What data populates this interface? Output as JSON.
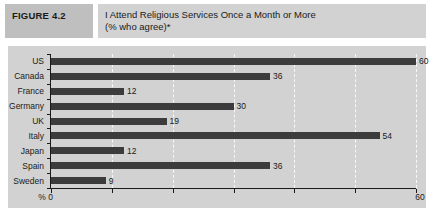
{
  "figure": {
    "label": "FIGURE 4.2",
    "title_line1": "I Attend Religious Services Once a Month or More",
    "title_line2": "(% who agree)*"
  },
  "chart_data": {
    "type": "bar",
    "orientation": "horizontal",
    "title": "I Attend Religious Services Once a Month or More (% who agree)*",
    "categories": [
      "US",
      "Canada",
      "France",
      "Germany",
      "UK",
      "Italy",
      "Japan",
      "Spain",
      "Sweden"
    ],
    "values": [
      60,
      36,
      12,
      30,
      19,
      54,
      12,
      36,
      9
    ],
    "xlim": [
      0,
      60
    ],
    "tick_interval": 10,
    "x_axis_left_label": "% 0",
    "x_axis_right_label": "60",
    "grid": "vertical-dashed-white",
    "legend": "none",
    "value_labels": "right-of-bar",
    "colors": {
      "bar": "#3c3c3c",
      "panel_bg": "#d2d2d2",
      "figure_label_bg": "#bfbfbf",
      "title_bg": "#d2d2d2",
      "gridline": "#ffffff",
      "axis": "#1a1a1a",
      "text": "#1a1a1a"
    }
  }
}
